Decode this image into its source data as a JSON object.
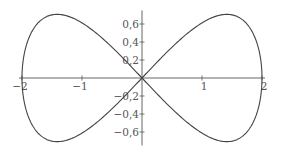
{
  "chart_data": {
    "type": "line",
    "title": "",
    "xlabel": "",
    "ylabel": "",
    "curve": "figure-eight (lemniscate of Gerono): x = 2cos t, y = sin(2t)/sqrt(2)",
    "series": [
      {
        "name": "curve",
        "x": [
          -2,
          -1.8,
          -1.6,
          -1.414,
          -1.2,
          -1.0,
          -0.8,
          -0.6,
          -0.4,
          -0.2,
          0,
          0.2,
          0.4,
          0.6,
          0.8,
          1.0,
          1.2,
          1.414,
          1.6,
          1.8,
          2
        ],
        "y_upper_abs": [
          0,
          0.553,
          0.679,
          0.707,
          0.679,
          0.612,
          0.518,
          0.405,
          0.277,
          0.141,
          0,
          0.141,
          0.277,
          0.405,
          0.518,
          0.612,
          0.679,
          0.707,
          0.679,
          0.553,
          0
        ]
      }
    ],
    "x_ticks": [
      -2,
      -1,
      1,
      2
    ],
    "x_tick_labels": [
      "−2",
      "−1",
      "1",
      "2"
    ],
    "y_ticks": [
      0.6,
      0.4,
      0.2,
      -0.2,
      -0.4,
      -0.6
    ],
    "y_tick_labels": [
      "0,6",
      "0,4",
      "0,2",
      "−0,2",
      "−0,4",
      "−0,6"
    ],
    "xlim": [
      -2.05,
      2.05
    ],
    "ylim": [
      -0.75,
      0.75
    ],
    "grid": false,
    "legend": "none"
  }
}
